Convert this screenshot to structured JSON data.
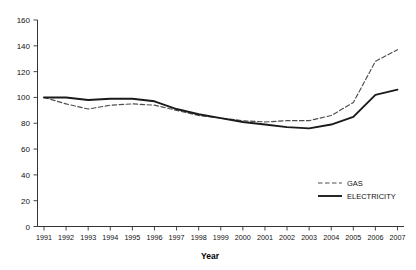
{
  "chart_data": {
    "type": "line",
    "title": "",
    "xlabel": "Year",
    "ylabel": "",
    "categories": [
      "1991",
      "1992",
      "1993",
      "1994",
      "1995",
      "1996",
      "1997",
      "1998",
      "1999",
      "2000",
      "2001",
      "2002",
      "2003",
      "2004",
      "2005",
      "2006",
      "2007"
    ],
    "x": [
      1991,
      1992,
      1993,
      1994,
      1995,
      1996,
      1997,
      1998,
      1999,
      2000,
      2001,
      2002,
      2003,
      2004,
      2005,
      2006,
      2007
    ],
    "series": [
      {
        "name": "GAS",
        "style": "dashed",
        "color": "#4d4d4d",
        "values": [
          100,
          95,
          91,
          94,
          95,
          94,
          90,
          86,
          84,
          82,
          81,
          82,
          82,
          86,
          96,
          128,
          137
        ]
      },
      {
        "name": "ELECTRICITY",
        "style": "solid",
        "color": "#1a1a1a",
        "values": [
          100,
          100,
          98,
          99,
          99,
          97,
          91,
          87,
          84,
          81,
          79,
          77,
          76,
          79,
          85,
          102,
          106
        ]
      }
    ],
    "ylim": [
      0,
      160
    ],
    "yticks": [
      0,
      20,
      40,
      60,
      80,
      100,
      120,
      140,
      160
    ],
    "ytick_labels": [
      "0",
      "20",
      "40",
      "60",
      "80",
      "100",
      "120",
      "140",
      "160"
    ],
    "xlim": [
      1991,
      2007
    ],
    "grid": false,
    "legend_position": "bottom-right",
    "legend": [
      {
        "label": "GAS",
        "style": "dashed"
      },
      {
        "label": "ELECTRICITY",
        "style": "solid"
      }
    ]
  }
}
